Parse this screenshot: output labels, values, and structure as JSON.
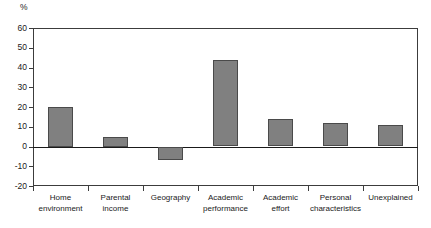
{
  "chart_data": {
    "type": "bar",
    "title": "",
    "subtitle": "",
    "xlabel": "",
    "ylabel": "%",
    "unit_label": "%",
    "ylim": [
      -20,
      60
    ],
    "ytick_step": 10,
    "yticks": [
      60,
      50,
      40,
      30,
      20,
      10,
      0,
      -10,
      -20
    ],
    "ytick_labels": [
      "60",
      "50",
      "40",
      "30",
      "20",
      "10",
      "0",
      "-10",
      "-20"
    ],
    "grid": false,
    "legend": null,
    "legend_position": "none",
    "zero_line": 0,
    "bar_color": "#808080",
    "bar_border_color": "#4a4a4a",
    "axis_color": "#3c3c3c",
    "categories": [
      "Home\nenvironment",
      "Parental\nincome",
      "Geography",
      "Academic\nperformance",
      "Academic\neffort",
      "Personal\ncharacteristics",
      "Unexplained"
    ],
    "values": [
      20,
      5,
      -7,
      44,
      14,
      12,
      11
    ]
  }
}
